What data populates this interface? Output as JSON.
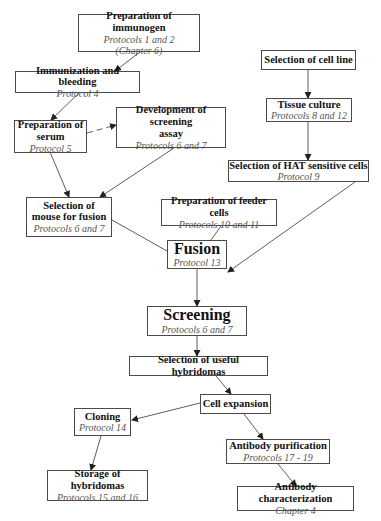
{
  "diagram": {
    "nodes": [
      {
        "id": "immunogen",
        "title": "Preparation of immunogen",
        "lines": [
          "Protocols 1 and 2",
          "(Chapter 6)"
        ]
      },
      {
        "id": "immunization",
        "title": "Immunization and bleeding",
        "lines": [
          "Protocol 4"
        ]
      },
      {
        "id": "serum",
        "title": "Preparation of serum",
        "title_lines": [
          "Preparation of",
          "serum"
        ],
        "lines": [
          "Protocol 5"
        ]
      },
      {
        "id": "screening_assay",
        "title": "Development of screening assay",
        "title_lines": [
          "Development of screening",
          "assay"
        ],
        "lines": [
          "Protocols 6 and 7"
        ]
      },
      {
        "id": "cell_line",
        "title": "Selection of cell line",
        "lines": []
      },
      {
        "id": "tissue_culture",
        "title": "Tissue culture",
        "lines": [
          "Protocols 8 and 12"
        ]
      },
      {
        "id": "hat_cells",
        "title": "Selection of HAT sensitive cells",
        "lines": [
          "Protocol 9"
        ]
      },
      {
        "id": "mouse_fusion",
        "title": "Selection of mouse for fusion",
        "title_lines": [
          "Selection of",
          "mouse for fusion"
        ],
        "lines": [
          "Protocols 6 and 7"
        ]
      },
      {
        "id": "feeder_cells",
        "title": "Preparation of feeder cells",
        "lines": [
          "Protocols 10 and 11"
        ]
      },
      {
        "id": "fusion",
        "title": "Fusion",
        "lines": [
          "Protocol 13"
        ]
      },
      {
        "id": "screening",
        "title": "Screening",
        "lines": [
          "Protocols 6 and 7"
        ]
      },
      {
        "id": "useful_hybridomas",
        "title": "Selection of useful hybridomas",
        "lines": []
      },
      {
        "id": "cell_expansion",
        "title": "Cell expansion",
        "lines": []
      },
      {
        "id": "cloning",
        "title": "Cloning",
        "lines": [
          "Protocol 14"
        ]
      },
      {
        "id": "antibody_purification",
        "title": "Antibody purification",
        "lines": [
          "Protocols 17 - 19"
        ]
      },
      {
        "id": "storage",
        "title": "Storage of hybridomas",
        "lines": [
          "Protocols 15 and 16"
        ]
      },
      {
        "id": "antibody_characterization",
        "title": "Antibody characterization",
        "lines": [
          "Chapter 4"
        ]
      }
    ],
    "edges": [
      {
        "from": "immunogen",
        "to": "immunization",
        "style": "solid"
      },
      {
        "from": "immunization",
        "to": "serum",
        "style": "solid"
      },
      {
        "from": "serum",
        "to": "screening_assay",
        "style": "dashed"
      },
      {
        "from": "serum",
        "to": "mouse_fusion",
        "style": "solid"
      },
      {
        "from": "screening_assay",
        "to": "mouse_fusion",
        "style": "solid"
      },
      {
        "from": "cell_line",
        "to": "tissue_culture",
        "style": "solid"
      },
      {
        "from": "tissue_culture",
        "to": "hat_cells",
        "style": "solid"
      },
      {
        "from": "mouse_fusion",
        "to": "fusion",
        "style": "solid"
      },
      {
        "from": "feeder_cells",
        "to": "fusion",
        "style": "solid"
      },
      {
        "from": "hat_cells",
        "to": "fusion",
        "style": "solid"
      },
      {
        "from": "fusion",
        "to": "screening",
        "style": "solid"
      },
      {
        "from": "screening",
        "to": "useful_hybridomas",
        "style": "solid"
      },
      {
        "from": "useful_hybridomas",
        "to": "cell_expansion",
        "style": "solid"
      },
      {
        "from": "cell_expansion",
        "to": "cloning",
        "style": "solid"
      },
      {
        "from": "cell_expansion",
        "to": "antibody_purification",
        "style": "solid"
      },
      {
        "from": "cloning",
        "to": "storage",
        "style": "solid"
      },
      {
        "from": "antibody_purification",
        "to": "antibody_characterization",
        "style": "solid"
      }
    ]
  },
  "colors": {
    "border": "#4a4a4a",
    "title_text": "#111111",
    "subtitle_text": "#555555",
    "edge": "#333333",
    "background": "#ffffff"
  }
}
